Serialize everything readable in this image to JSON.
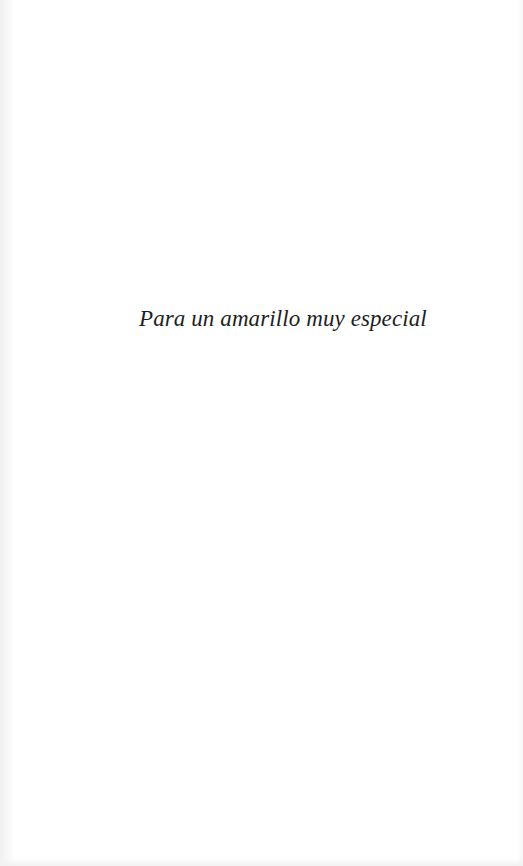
{
  "page": {
    "type": "dedication",
    "background_color": "#ffffff",
    "text_color": "#1e1e1e"
  },
  "dedication": {
    "text": "Para un amarillo muy especial"
  }
}
